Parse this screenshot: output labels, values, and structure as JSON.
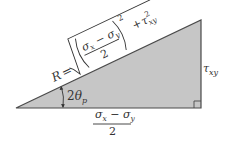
{
  "diagram": {
    "type": "right-triangle",
    "colors": {
      "fill": "#c6c6c6",
      "stroke": "#4a4a4a",
      "text": "#333333"
    },
    "vertices": {
      "left": [
        16,
        108
      ],
      "right_angle": [
        201,
        108
      ],
      "top": [
        201,
        20
      ]
    },
    "labels": {
      "hypotenuse": {
        "lhs": "R",
        "equals": "=",
        "numerator_sigma_x": "σ",
        "sub_x": "x",
        "minus": " − ",
        "numerator_sigma_y": "σ",
        "sub_y": "y",
        "denominator": "2",
        "exponent": "2",
        "plus": "+",
        "tau": "τ",
        "tau_exp": "2",
        "tau_sub": "xy"
      },
      "vertical_side": {
        "tau": "τ",
        "sub": "xy"
      },
      "angle": {
        "coef": "2",
        "theta": "θ",
        "sub": "p"
      },
      "horizontal_side": {
        "sigma_x": "σ",
        "sub_x": "x",
        "minus": " − ",
        "sigma_y": "σ",
        "sub_y": "y",
        "denominator": "2"
      }
    }
  }
}
